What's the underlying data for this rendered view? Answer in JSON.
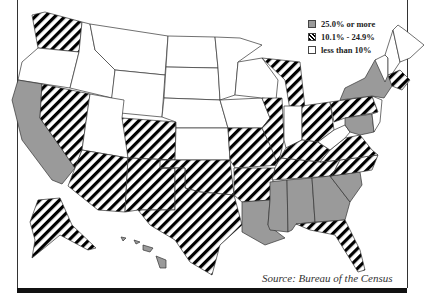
{
  "legend": {
    "items": [
      {
        "label": "25.0% or more",
        "pattern": "gray",
        "color": "#9a9a9a"
      },
      {
        "label": "10.1% - 24.9%",
        "pattern": "hatched",
        "color": "#000000"
      },
      {
        "label": "less than 10%",
        "pattern": "white",
        "color": "#ffffff"
      }
    ]
  },
  "source": "Source: Bureau of the Census",
  "map": {
    "categories": {
      "gray_25_plus": [
        "California",
        "New York",
        "Louisiana",
        "Mississippi",
        "Alabama",
        "Georgia",
        "South Carolina",
        "Maryland",
        "Hawaii"
      ],
      "hatched_10_to_24_9": [
        "Washington",
        "Nevada",
        "Colorado",
        "Arizona",
        "New Mexico",
        "Texas",
        "Oklahoma",
        "Missouri",
        "Illinois",
        "Michigan",
        "Ohio",
        "Pennsylvania",
        "Massachusetts",
        "Connecticut",
        "Arkansas",
        "Tennessee",
        "Kentucky",
        "Virginia",
        "North Carolina",
        "Florida",
        "Alaska",
        "Delaware",
        "New Jersey"
      ],
      "white_under_10": [
        "Oregon",
        "Idaho",
        "Montana",
        "Wyoming",
        "Utah",
        "North Dakota",
        "South Dakota",
        "Nebraska",
        "Kansas",
        "Minnesota",
        "Iowa",
        "Wisconsin",
        "Indiana",
        "West Virginia",
        "Maine",
        "New Hampshire",
        "Vermont"
      ]
    }
  }
}
